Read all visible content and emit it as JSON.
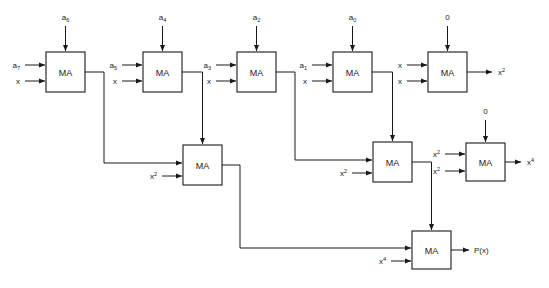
{
  "diagram": {
    "block_label": "MA",
    "line_color": "#1a1a1a",
    "background": "#ffffff",
    "blocks": [
      {
        "id": "ma-r1-c1",
        "label": "MA",
        "row": 1,
        "col": 1,
        "top_input": "a6",
        "left_inputs": [
          "a7",
          "x"
        ]
      },
      {
        "id": "ma-r1-c2",
        "label": "MA",
        "row": 1,
        "col": 2,
        "top_input": "a4",
        "left_inputs": [
          "a5",
          "x"
        ]
      },
      {
        "id": "ma-r1-c3",
        "label": "MA",
        "row": 1,
        "col": 3,
        "top_input": "a2",
        "left_inputs": [
          "a3",
          "x"
        ]
      },
      {
        "id": "ma-r1-c4",
        "label": "MA",
        "row": 1,
        "col": 4,
        "top_input": "a0",
        "left_inputs": [
          "a1",
          "x"
        ]
      },
      {
        "id": "ma-r1-c5",
        "label": "MA",
        "row": 1,
        "col": 5,
        "top_input": "0",
        "left_inputs": [
          "x",
          "x"
        ],
        "output": "x2"
      },
      {
        "id": "ma-r2-c1",
        "label": "MA",
        "row": 2,
        "col": 1,
        "left_inputs": [
          "",
          "x2"
        ]
      },
      {
        "id": "ma-r2-c2",
        "label": "MA",
        "row": 2,
        "col": 2,
        "left_inputs": [
          "",
          "x2"
        ]
      },
      {
        "id": "ma-r2-c3",
        "label": "MA",
        "row": 2,
        "col": 3,
        "top_input": "0",
        "left_inputs": [
          "x2",
          "x2"
        ],
        "output": "x4"
      },
      {
        "id": "ma-r3-c1",
        "label": "MA",
        "row": 3,
        "col": 1,
        "left_inputs": [
          "",
          "x4"
        ],
        "output": "P(x)"
      }
    ],
    "labels": {
      "a6": "a",
      "a6_sub": "6",
      "a7": "a",
      "a7_sub": "7",
      "a5": "a",
      "a5_sub": "5",
      "a4": "a",
      "a4_sub": "4",
      "a3": "a",
      "a3_sub": "3",
      "a2": "a",
      "a2_sub": "2",
      "a1": "a",
      "a1_sub": "1",
      "a0": "a",
      "a0_sub": "0",
      "x": "x",
      "zero": "0",
      "x_sq_base": "x",
      "x_sq_exp": "2",
      "x_four_base": "x",
      "x_four_exp": "4",
      "px": "P(x)"
    }
  }
}
